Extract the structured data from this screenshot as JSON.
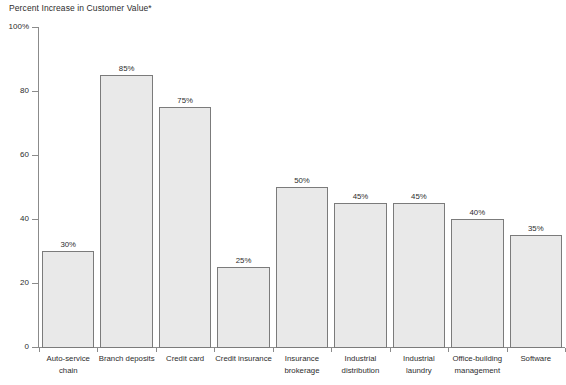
{
  "chart_data": {
    "type": "bar",
    "title": "Percent Increase in Customer Value*",
    "xlabel": "",
    "ylabel": "",
    "ylim": [
      0,
      100
    ],
    "grid": false,
    "legend": "none",
    "y_ticks": [
      "0",
      "20",
      "40",
      "60",
      "80",
      "100%"
    ],
    "categories": [
      "Auto-service chain",
      "Branch deposits",
      "Credit card",
      "Credit insurance",
      "Insurance brokerage",
      "Industrial distribution",
      "Industrial laundry",
      "Office-building management",
      "Software"
    ],
    "category_lines": [
      [
        "Auto-service",
        "chain"
      ],
      [
        "Branch deposits",
        ""
      ],
      [
        "Credit card",
        ""
      ],
      [
        "Credit insurance",
        ""
      ],
      [
        "Insurance",
        "brokerage"
      ],
      [
        "Industrial",
        "distribution"
      ],
      [
        "Industrial",
        "laundry"
      ],
      [
        "Office-building",
        "management"
      ],
      [
        "Software",
        ""
      ]
    ],
    "values": [
      30,
      85,
      75,
      25,
      50,
      45,
      45,
      40,
      35
    ],
    "value_labels": [
      "30%",
      "85%",
      "75%",
      "25%",
      "50%",
      "45%",
      "45%",
      "40%",
      "35%"
    ],
    "colors": {
      "bar_fill": "#e9e9e9",
      "bar_stroke": "#7b7b7b",
      "axis": "#8b8b8b",
      "text": "#2d2d2d",
      "background": "#ffffff"
    }
  }
}
